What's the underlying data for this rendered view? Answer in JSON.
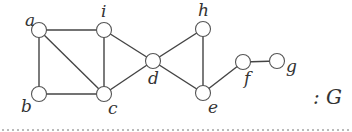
{
  "graph": {
    "name": "G",
    "caption": ": G",
    "nodes": [
      {
        "id": "a",
        "label": "a",
        "x": 39,
        "y": 30,
        "lx": 25,
        "ly": 26
      },
      {
        "id": "i",
        "label": "i",
        "x": 104,
        "y": 30,
        "lx": 101,
        "ly": 17
      },
      {
        "id": "b",
        "label": "b",
        "x": 39,
        "y": 94,
        "lx": 21,
        "ly": 112
      },
      {
        "id": "c",
        "label": "c",
        "x": 104,
        "y": 94,
        "lx": 108,
        "ly": 114
      },
      {
        "id": "d",
        "label": "d",
        "x": 153,
        "y": 61,
        "lx": 148,
        "ly": 84
      },
      {
        "id": "h",
        "label": "h",
        "x": 203,
        "y": 29,
        "lx": 198,
        "ly": 16
      },
      {
        "id": "e",
        "label": "e",
        "x": 203,
        "y": 93,
        "lx": 208,
        "ly": 113
      },
      {
        "id": "f",
        "label": "f",
        "x": 243,
        "y": 62,
        "lx": 244,
        "ly": 84
      },
      {
        "id": "g",
        "label": "g",
        "x": 277,
        "y": 61,
        "lx": 286,
        "ly": 72
      }
    ],
    "edges": [
      [
        "a",
        "i"
      ],
      [
        "a",
        "b"
      ],
      [
        "a",
        "c"
      ],
      [
        "i",
        "c"
      ],
      [
        "b",
        "c"
      ],
      [
        "i",
        "d"
      ],
      [
        "c",
        "d"
      ],
      [
        "d",
        "h"
      ],
      [
        "d",
        "e"
      ],
      [
        "h",
        "e"
      ],
      [
        "e",
        "f"
      ],
      [
        "f",
        "g"
      ]
    ],
    "node_radius": 7.5
  },
  "caption_label": ": G"
}
